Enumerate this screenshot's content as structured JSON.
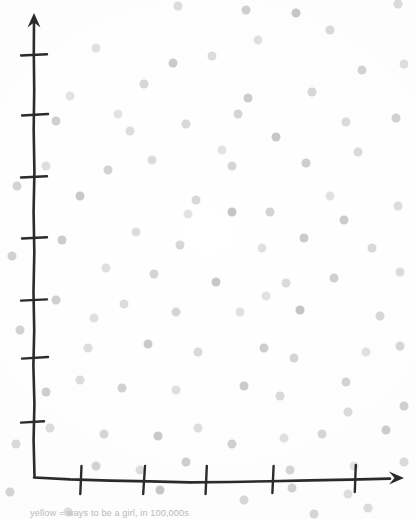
{
  "page": {
    "background_color": "#fdfdfd",
    "width": 416,
    "height": 519
  },
  "caption": {
    "text": "yellow = ways to be a girl, in 100,000s",
    "color": "#b9b9b9"
  },
  "axes": {
    "ink_color": "#2b2b2b",
    "origin": [
      34,
      478
    ],
    "y_axis": {
      "top": 14,
      "bottom": 478,
      "arrow": "up-arrow",
      "tick_count": 7,
      "tick_y": [
        55,
        115,
        177,
        238,
        300,
        358,
        422
      ]
    },
    "x_axis": {
      "left": 34,
      "right": 404,
      "arrow": "right-arrow",
      "tick_count": 5,
      "tick_x": [
        81,
        144,
        206,
        273,
        355
      ]
    }
  },
  "chart_data": {
    "type": "scatter",
    "title": "",
    "xlabel": "",
    "ylabel": "",
    "legend": [
      "yellow = ways to be a girl, in 100,000s"
    ],
    "legend_position": "below-axis",
    "grid": false,
    "xlim": [
      0,
      416
    ],
    "ylim": [
      0,
      519
    ],
    "axis_units": "hand-drawn, unlabeled ticks",
    "marker": {
      "shape": "circle",
      "diameter_px": 9,
      "colors": [
        "#e9e9e9",
        "#dedede",
        "#d3d3d3",
        "#c8c8c8",
        "#bdbdbd"
      ]
    },
    "note": "Pixel coordinates of hand-stamped dots; y measured from top of image.",
    "points": [
      {
        "x": 178,
        "y": 6,
        "r": 4.5,
        "c": "#dcdcdc"
      },
      {
        "x": 246,
        "y": 10,
        "r": 4.5,
        "c": "#cfcfcf"
      },
      {
        "x": 296,
        "y": 13,
        "r": 4.5,
        "c": "#c6c6c6"
      },
      {
        "x": 398,
        "y": 4,
        "r": 4.5,
        "c": "#dadada"
      },
      {
        "x": 96,
        "y": 48,
        "r": 4.5,
        "c": "#dfdfdf"
      },
      {
        "x": 173,
        "y": 63,
        "r": 4.5,
        "c": "#cacaca"
      },
      {
        "x": 212,
        "y": 56,
        "r": 4.5,
        "c": "#dcdcdc"
      },
      {
        "x": 362,
        "y": 70,
        "r": 4.5,
        "c": "#d2d2d2"
      },
      {
        "x": 404,
        "y": 64,
        "r": 4.5,
        "c": "#dddddd"
      },
      {
        "x": 144,
        "y": 84,
        "r": 4.5,
        "c": "#d6d6d6"
      },
      {
        "x": 248,
        "y": 98,
        "r": 4.5,
        "c": "#cdcdcd"
      },
      {
        "x": 312,
        "y": 92,
        "r": 4.5,
        "c": "#dededе"
      },
      {
        "x": 70,
        "y": 96,
        "r": 4.5,
        "c": "#e2e2e2"
      },
      {
        "x": 186,
        "y": 124,
        "r": 4.5,
        "c": "#d8d8d8"
      },
      {
        "x": 56,
        "y": 121,
        "r": 4.5,
        "c": "#cfcfcf"
      },
      {
        "x": 130,
        "y": 131,
        "r": 4.5,
        "c": "#dcdcdc"
      },
      {
        "x": 238,
        "y": 114,
        "r": 4.5,
        "c": "#d4d4d4"
      },
      {
        "x": 276,
        "y": 137,
        "r": 4.5,
        "c": "#c7c7c7"
      },
      {
        "x": 346,
        "y": 122,
        "r": 4.5,
        "c": "#d9d9d9"
      },
      {
        "x": 396,
        "y": 118,
        "r": 4.5,
        "c": "#d0d0d0"
      },
      {
        "x": 358,
        "y": 152,
        "r": 4.5,
        "c": "#dadada"
      },
      {
        "x": 306,
        "y": 163,
        "r": 4.5,
        "c": "#cecece"
      },
      {
        "x": 232,
        "y": 166,
        "r": 4.5,
        "c": "#d5d5d5"
      },
      {
        "x": 152,
        "y": 160,
        "r": 4.5,
        "c": "#dbdbdb"
      },
      {
        "x": 108,
        "y": 170,
        "r": 4.5,
        "c": "#d2d2d2"
      },
      {
        "x": 46,
        "y": 166,
        "r": 4.5,
        "c": "#dedede"
      },
      {
        "x": 17,
        "y": 186,
        "r": 4.5,
        "c": "#d4d4d4"
      },
      {
        "x": 80,
        "y": 196,
        "r": 4.5,
        "c": "#c9c9c9"
      },
      {
        "x": 196,
        "y": 200,
        "r": 4.5,
        "c": "#d7d7d7"
      },
      {
        "x": 232,
        "y": 212,
        "r": 4.5,
        "c": "#c4c4c4"
      },
      {
        "x": 270,
        "y": 212,
        "r": 4.5,
        "c": "#d3d3d3"
      },
      {
        "x": 344,
        "y": 220,
        "r": 4.5,
        "c": "#cccccc"
      },
      {
        "x": 398,
        "y": 206,
        "r": 4.5,
        "c": "#dcdcdc"
      },
      {
        "x": 62,
        "y": 240,
        "r": 4.5,
        "c": "#cdcdcd"
      },
      {
        "x": 136,
        "y": 232,
        "r": 4.5,
        "c": "#dddddd"
      },
      {
        "x": 180,
        "y": 245,
        "r": 4.5,
        "c": "#d6d6d6"
      },
      {
        "x": 262,
        "y": 248,
        "r": 4.5,
        "c": "#e0e0e0"
      },
      {
        "x": 304,
        "y": 238,
        "r": 4.5,
        "c": "#cbcbcb"
      },
      {
        "x": 372,
        "y": 248,
        "r": 4.5,
        "c": "#d8d8d8"
      },
      {
        "x": 12,
        "y": 256,
        "r": 4.5,
        "c": "#d1d1d1"
      },
      {
        "x": 106,
        "y": 268,
        "r": 4.5,
        "c": "#dedede"
      },
      {
        "x": 154,
        "y": 274,
        "r": 4.5,
        "c": "#d4d4d4"
      },
      {
        "x": 216,
        "y": 282,
        "r": 4.5,
        "c": "#c8c8c8"
      },
      {
        "x": 286,
        "y": 283,
        "r": 4.5,
        "c": "#dadada"
      },
      {
        "x": 334,
        "y": 278,
        "r": 4.5,
        "c": "#d0d0d0"
      },
      {
        "x": 400,
        "y": 272,
        "r": 4.5,
        "c": "#dcdcdc"
      },
      {
        "x": 56,
        "y": 300,
        "r": 4.5,
        "c": "#cfcfcf"
      },
      {
        "x": 124,
        "y": 304,
        "r": 4.5,
        "c": "#dbdbdb"
      },
      {
        "x": 176,
        "y": 312,
        "r": 4.5,
        "c": "#d5d5d5"
      },
      {
        "x": 240,
        "y": 312,
        "r": 4.5,
        "c": "#e1e1e1"
      },
      {
        "x": 300,
        "y": 310,
        "r": 4.5,
        "c": "#c5c5c5"
      },
      {
        "x": 380,
        "y": 316,
        "r": 4.5,
        "c": "#d7d7d7"
      },
      {
        "x": 20,
        "y": 330,
        "r": 4.5,
        "c": "#d2d2d2"
      },
      {
        "x": 88,
        "y": 348,
        "r": 4.5,
        "c": "#dddddd"
      },
      {
        "x": 148,
        "y": 344,
        "r": 4.5,
        "c": "#cacaca"
      },
      {
        "x": 198,
        "y": 352,
        "r": 4.5,
        "c": "#d9d9d9"
      },
      {
        "x": 264,
        "y": 348,
        "r": 4.5,
        "c": "#cdcdcd"
      },
      {
        "x": 294,
        "y": 358,
        "r": 4.5,
        "c": "#d4d4d4"
      },
      {
        "x": 366,
        "y": 352,
        "r": 4.5,
        "c": "#e0e0e0"
      },
      {
        "x": 400,
        "y": 346,
        "r": 4.5,
        "c": "#d6d6d6"
      },
      {
        "x": 46,
        "y": 392,
        "r": 4.5,
        "c": "#cecece"
      },
      {
        "x": 80,
        "y": 380,
        "r": 4.5,
        "c": "#dcdcdc"
      },
      {
        "x": 122,
        "y": 388,
        "r": 4.5,
        "c": "#d1d1d1"
      },
      {
        "x": 176,
        "y": 390,
        "r": 4.5,
        "c": "#dfdfdf"
      },
      {
        "x": 244,
        "y": 386,
        "r": 4.5,
        "c": "#cbcbcb"
      },
      {
        "x": 280,
        "y": 396,
        "r": 4.5,
        "c": "#d8d8d8"
      },
      {
        "x": 346,
        "y": 382,
        "r": 4.5,
        "c": "#d3d3d3"
      },
      {
        "x": 348,
        "y": 412,
        "r": 4.5,
        "c": "#dadada"
      },
      {
        "x": 404,
        "y": 406,
        "r": 4.5,
        "c": "#cfcfcf"
      },
      {
        "x": 50,
        "y": 428,
        "r": 4.5,
        "c": "#dbdbdb"
      },
      {
        "x": 104,
        "y": 434,
        "r": 4.5,
        "c": "#d5d5d5"
      },
      {
        "x": 158,
        "y": 436,
        "r": 4.5,
        "c": "#c9c9c9"
      },
      {
        "x": 198,
        "y": 428,
        "r": 4.5,
        "c": "#dddddd"
      },
      {
        "x": 232,
        "y": 444,
        "r": 4.5,
        "c": "#d0d0d0"
      },
      {
        "x": 284,
        "y": 438,
        "r": 4.5,
        "c": "#e0e0e0"
      },
      {
        "x": 322,
        "y": 434,
        "r": 4.5,
        "c": "#d6d6d6"
      },
      {
        "x": 386,
        "y": 430,
        "r": 4.5,
        "c": "#cccccc"
      },
      {
        "x": 16,
        "y": 444,
        "r": 4.5,
        "c": "#d9d9d9"
      },
      {
        "x": 96,
        "y": 466,
        "r": 4.5,
        "c": "#d2d2d2"
      },
      {
        "x": 140,
        "y": 470,
        "r": 4.5,
        "c": "#dcdcdc"
      },
      {
        "x": 186,
        "y": 462,
        "r": 4.5,
        "c": "#cecece"
      },
      {
        "x": 290,
        "y": 470,
        "r": 4.5,
        "c": "#d4d4d4"
      },
      {
        "x": 404,
        "y": 462,
        "r": 4.5,
        "c": "#dadada"
      },
      {
        "x": 160,
        "y": 490,
        "r": 4.5,
        "c": "#c7c7c7"
      },
      {
        "x": 244,
        "y": 500,
        "r": 4.5,
        "c": "#d7d7d7"
      },
      {
        "x": 292,
        "y": 488,
        "r": 4.5,
        "c": "#d1d1d1"
      },
      {
        "x": 348,
        "y": 494,
        "r": 4.5,
        "c": "#dedede"
      },
      {
        "x": 10,
        "y": 492,
        "r": 4.5,
        "c": "#d3d3d3"
      },
      {
        "x": 368,
        "y": 508,
        "r": 4.5,
        "c": "#dbdbdb"
      },
      {
        "x": 314,
        "y": 514,
        "r": 4.5,
        "c": "#d5d5d5"
      },
      {
        "x": 68,
        "y": 512,
        "r": 4.5,
        "c": "#dddddd"
      },
      {
        "x": 330,
        "y": 30,
        "r": 4.5,
        "c": "#d8d8d8"
      },
      {
        "x": 258,
        "y": 40,
        "r": 4.5,
        "c": "#dfdfdf"
      },
      {
        "x": 188,
        "y": 214,
        "r": 4.5,
        "c": "#e2e2e2"
      },
      {
        "x": 330,
        "y": 196,
        "r": 4.5,
        "c": "#e1e1e1"
      },
      {
        "x": 118,
        "y": 114,
        "r": 4.5,
        "c": "#e3e3e3"
      },
      {
        "x": 222,
        "y": 150,
        "r": 4.5,
        "c": "#e2e2e2"
      },
      {
        "x": 266,
        "y": 296,
        "r": 4.5,
        "c": "#e1e1e1"
      },
      {
        "x": 94,
        "y": 318,
        "r": 4.5,
        "c": "#e0e0e0"
      },
      {
        "x": 354,
        "y": 466,
        "r": 4.5,
        "c": "#e2e2e2"
      }
    ]
  }
}
